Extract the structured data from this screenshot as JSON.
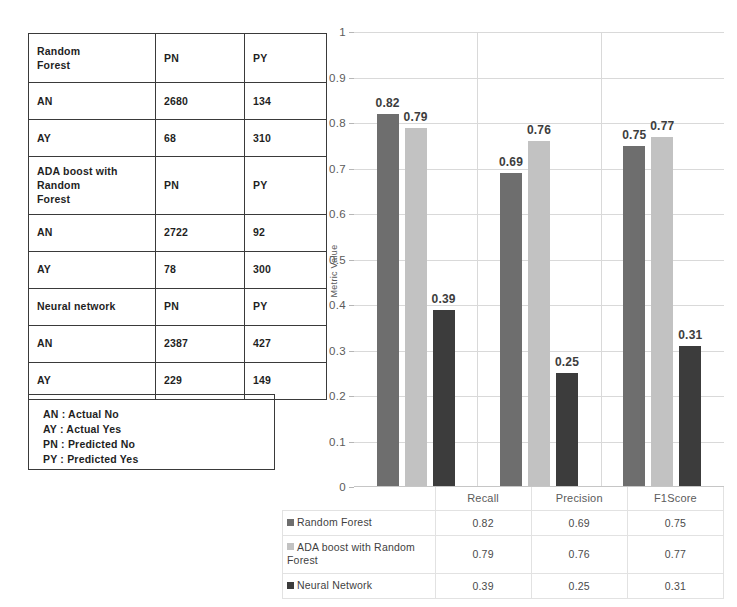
{
  "confusion_tables": {
    "rows": [
      {
        "tall": true,
        "cells": [
          "Random\nForest",
          "PN",
          "PY"
        ]
      },
      {
        "tall": false,
        "cells": [
          "AN",
          "2680",
          "134"
        ]
      },
      {
        "tall": false,
        "cells": [
          "AY",
          "68",
          "310"
        ]
      },
      {
        "tall": true,
        "cells": [
          "ADA boost with\nRandom\nForest",
          "PN",
          "PY"
        ]
      },
      {
        "tall": false,
        "cells": [
          "AN",
          "2722",
          "92"
        ]
      },
      {
        "tall": false,
        "cells": [
          "AY",
          "78",
          "300"
        ]
      },
      {
        "tall": false,
        "cells": [
          "Neural network",
          "PN",
          "PY"
        ]
      },
      {
        "tall": false,
        "cells": [
          "AN",
          "2387",
          "427"
        ]
      },
      {
        "tall": false,
        "cells": [
          "AY",
          "229",
          "149"
        ]
      }
    ]
  },
  "abbreviation_legend": {
    "lines": [
      "AN : Actual No",
      "AY : Actual Yes",
      "PN : Predicted No",
      "PY : Predicted Yes"
    ]
  },
  "chart_data": {
    "type": "bar",
    "title": "",
    "xlabel": "",
    "ylabel": "Metric Value",
    "ylim": [
      0,
      1
    ],
    "yticks": [
      "0",
      "0.1",
      "0.2",
      "0.3",
      "0.4",
      "0.5",
      "0.6",
      "0.7",
      "0.8",
      "0.9",
      "1"
    ],
    "grid": true,
    "legend_position": "data-table-below",
    "categories": [
      "Recall",
      "Precision",
      "F1Score"
    ],
    "series": [
      {
        "name": "Random Forest",
        "color": "#6e6e6e",
        "values": [
          0.82,
          0.69,
          0.75
        ],
        "labels": [
          "0.82",
          "0.69",
          "0.75"
        ]
      },
      {
        "name": "ADA boost with Random Forest",
        "color": "#c2c2c2",
        "values": [
          0.79,
          0.76,
          0.77
        ],
        "labels": [
          "0.79",
          "0.76",
          "0.77"
        ]
      },
      {
        "name": "Neural Network",
        "color": "#3c3c3c",
        "values": [
          0.39,
          0.25,
          0.31
        ],
        "labels": [
          "0.39",
          "0.25",
          "0.31"
        ]
      }
    ]
  }
}
